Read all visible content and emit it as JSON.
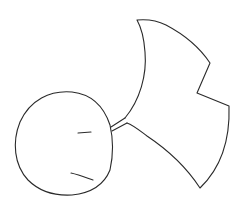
{
  "drawing": {
    "subject": "ginkgo leaf sketch",
    "stroke_color": "#2a2a2a",
    "background": "#ffffff",
    "parts": [
      "round-shape",
      "stem",
      "fan-leaf",
      "inner-marks"
    ]
  }
}
